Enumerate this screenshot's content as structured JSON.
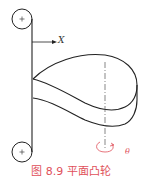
{
  "figure": {
    "caption": "图 8.9  平面凸轮",
    "x_axis_label": "X",
    "rotation_label": "θ",
    "colors": {
      "line": "#222222",
      "centerline": "#555555",
      "accent": "#e0505a"
    },
    "elements": [
      "top-pulley",
      "bottom-pulley",
      "belt-follower",
      "x-arrow",
      "cam-profile",
      "cam-centerline",
      "rotation-arrow"
    ]
  }
}
